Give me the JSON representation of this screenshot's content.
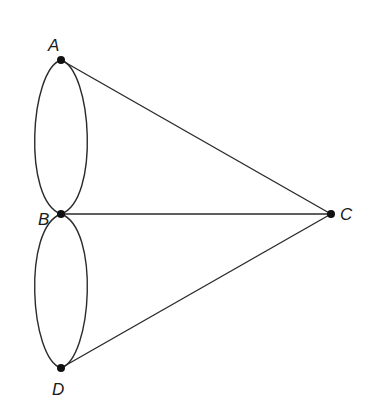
{
  "diagram": {
    "type": "graph",
    "nodes": [
      {
        "id": "A",
        "label": "A",
        "x": 61,
        "y": 60,
        "lx": 48,
        "ly": 51
      },
      {
        "id": "B",
        "label": "B",
        "x": 61,
        "y": 214,
        "lx": 38,
        "ly": 225
      },
      {
        "id": "C",
        "label": "C",
        "x": 331,
        "y": 214,
        "lx": 340,
        "ly": 220
      },
      {
        "id": "D",
        "label": "D",
        "x": 61,
        "y": 368,
        "lx": 52,
        "ly": 395
      }
    ],
    "edges": [
      {
        "from": "A",
        "to": "B",
        "kind": "arc-left"
      },
      {
        "from": "A",
        "to": "B",
        "kind": "arc-right"
      },
      {
        "from": "B",
        "to": "D",
        "kind": "arc-left"
      },
      {
        "from": "B",
        "to": "D",
        "kind": "arc-right"
      },
      {
        "from": "A",
        "to": "C",
        "kind": "line"
      },
      {
        "from": "B",
        "to": "C",
        "kind": "line"
      },
      {
        "from": "D",
        "to": "C",
        "kind": "line"
      }
    ]
  }
}
